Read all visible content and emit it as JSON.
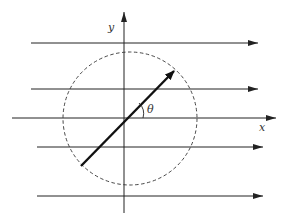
{
  "diagram": {
    "labels": {
      "x_axis": "x",
      "y_axis": "y",
      "angle": "θ"
    },
    "streamlines": {
      "count": 5,
      "direction": "left-to-right"
    },
    "plate": {
      "angle_label": "θ",
      "angle_degrees_approx": 45
    },
    "boundary": {
      "shape": "circle",
      "style": "dashed"
    },
    "colors": {
      "line": "#222222",
      "plate": "#111111",
      "background": "#ffffff"
    }
  }
}
